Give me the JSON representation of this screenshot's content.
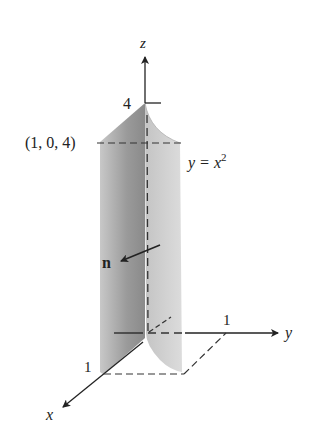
{
  "diagram": {
    "axes": {
      "z_label": "z",
      "y_label": "y",
      "x_label": "x",
      "z_tick": "4",
      "y_tick": "1",
      "x_tick": "1"
    },
    "point_label": "(1, 0, 4)",
    "surface_label_lhs": "y = x",
    "surface_label_exp": "2",
    "normal_label": "n",
    "colors": {
      "axis": "#222222",
      "surface_dark": "#8a8a8a",
      "surface_light": "#d6d6d6",
      "background": "#ffffff"
    }
  }
}
